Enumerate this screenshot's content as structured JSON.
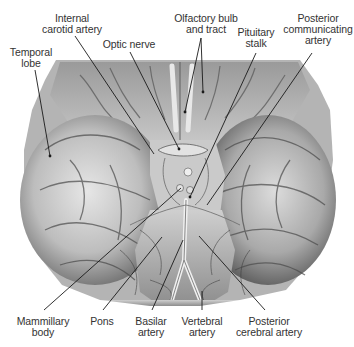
{
  "figure": {
    "labels_top": [
      {
        "id": "temporal-lobe",
        "lines": [
          "Temporal",
          "lobe"
        ],
        "x": 30,
        "y": 47,
        "target": [
          50,
          156
        ]
      },
      {
        "id": "internal-carotid-artery",
        "lines": [
          "Internal",
          "carotid artery"
        ],
        "x": 67,
        "y": 18,
        "target": [
          180,
          154
        ]
      },
      {
        "id": "optic-nerve",
        "lines": [
          "Optic nerve"
        ],
        "x": 129,
        "y": 40,
        "target": [
          180,
          148
        ]
      },
      {
        "id": "olfactory-bulb-and-tract",
        "lines": [
          "Olfactory bulb",
          "and tract"
        ],
        "x": 206,
        "y": 18,
        "targets": [
          [
            202,
            62
          ],
          [
            183,
            103
          ]
        ]
      },
      {
        "id": "pituitary-stalk",
        "lines": [
          "Pituitary",
          "stalk"
        ],
        "x": 256,
        "y": 29,
        "target": [
          190,
          197
        ]
      },
      {
        "id": "posterior-communicating-artery",
        "lines": [
          "Posterior",
          "communicating",
          "artery"
        ],
        "x": 318,
        "y": 18,
        "target": [
          207,
          205
        ]
      }
    ],
    "labels_bottom": [
      {
        "id": "mammillary-body",
        "lines": [
          "Mammillary",
          "body"
        ],
        "x": 43,
        "y": 317,
        "target": [
          180,
          187
        ]
      },
      {
        "id": "pons",
        "lines": [
          "Pons"
        ],
        "x": 100,
        "y": 317,
        "target": [
          162,
          237
        ]
      },
      {
        "id": "basilar-artery",
        "lines": [
          "Basilar",
          "artery"
        ],
        "x": 150,
        "y": 317,
        "target": [
          182,
          240
        ]
      },
      {
        "id": "vertebral-artery",
        "lines": [
          "Vertebral",
          "artery"
        ],
        "x": 200,
        "y": 317,
        "target": [
          202,
          290
        ]
      },
      {
        "id": "posterior-cerebral-artery",
        "lines": [
          "Posterior",
          "cerebral artery"
        ],
        "x": 268,
        "y": 317,
        "target": [
          199,
          236
        ]
      }
    ],
    "colors": {
      "background": "#ffffff",
      "label_text": "#333333",
      "leader_line": "#1a1a1a",
      "tissue_light": "#d9d9d9",
      "tissue_mid": "#a8a8a8",
      "tissue_dark": "#4a4a4a"
    }
  }
}
